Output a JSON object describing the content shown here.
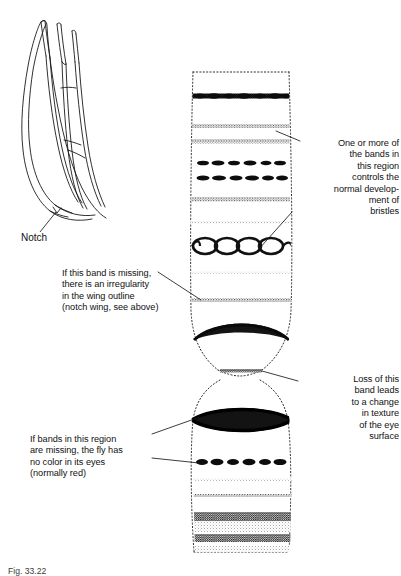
{
  "figure": {
    "caption": "Fig. 33.22",
    "ink_color": "#1a1a1a",
    "background_color": "#ffffff"
  },
  "wing_inset": {
    "name": "notched wing of Drosophila",
    "label": "Notch"
  },
  "annotations": [
    {
      "id": "bristles",
      "align": "right",
      "text": "One or more of\nthe bands in\nthis region\ncontrols the\nnormal develop-\nment of\nbristles"
    },
    {
      "id": "eye-texture",
      "align": "right",
      "text": "Loss of this\nband leads\nto a change\nin texture\nof the eye\nsurface"
    },
    {
      "id": "notch-band",
      "align": "left",
      "text": "If this band is missing,\nthere is an irregularity\nin the wing outline\n(notch wing, see above)"
    },
    {
      "id": "eye-color",
      "align": "left",
      "text": "If bands in this region\nare missing, the fly has\nno color in its eyes\n(normally red)"
    }
  ],
  "chromosome": {
    "name": "polytene chromosome",
    "left_edge": 192,
    "right_edge": 288,
    "top": 72,
    "bottom": 552,
    "bands": [
      {
        "y": 96,
        "style": "heavy-beaded",
        "weight": 5.0
      },
      {
        "y": 126,
        "style": "fine-stipple",
        "weight": 3.4
      },
      {
        "y": 141,
        "style": "fine-stipple",
        "weight": 3.6
      },
      {
        "y": 163,
        "style": "beaded",
        "weight": 4.2
      },
      {
        "y": 178,
        "style": "beaded",
        "weight": 4.2
      },
      {
        "y": 199,
        "style": "fine-stipple",
        "weight": 3.6
      },
      {
        "y": 222,
        "style": "fine-stipple",
        "weight": 2.6
      },
      {
        "y": 246,
        "style": "loop-chain",
        "weight": 6.0
      },
      {
        "y": 272,
        "style": "fine-stipple",
        "weight": 2.6
      },
      {
        "y": 300,
        "style": "fine-stipple",
        "weight": 3.4
      },
      {
        "y": 330,
        "style": "lens",
        "weight": 7.0
      },
      {
        "y": 385,
        "style": "fine-stipple",
        "weight": 2.8
      },
      {
        "y": 420,
        "style": "lens-heavy",
        "weight": 9.0
      },
      {
        "y": 462,
        "style": "beaded",
        "weight": 5.0
      },
      {
        "y": 479,
        "style": "fine-stipple",
        "weight": 2.6
      },
      {
        "y": 496,
        "style": "fine-stipple",
        "weight": 2.8
      },
      {
        "y": 519,
        "style": "dense-texture",
        "weight": 8.0
      },
      {
        "y": 541,
        "style": "dense-texture",
        "weight": 7.0
      }
    ],
    "constriction_y": 370
  },
  "leader_lines": [
    {
      "from": "bristles",
      "x1": 300,
      "y1": 141,
      "x2": 276,
      "y2": 131
    },
    {
      "from": "bristles",
      "x1": 292,
      "y1": 212,
      "x2": 258,
      "y2": 248
    },
    {
      "from": "eye-texture",
      "x1": 298,
      "y1": 381,
      "x2": 264,
      "y2": 370
    },
    {
      "from": "notch-band",
      "x1": 158,
      "y1": 272,
      "x2": 200,
      "y2": 300
    },
    {
      "from": "eye-color",
      "x1": 152,
      "y1": 434,
      "x2": 202,
      "y2": 418
    },
    {
      "from": "eye-color",
      "x1": 152,
      "y1": 458,
      "x2": 200,
      "y2": 463
    },
    {
      "from": "notch-wing",
      "x1": 40,
      "y1": 232,
      "x2": 56,
      "y2": 212
    }
  ]
}
